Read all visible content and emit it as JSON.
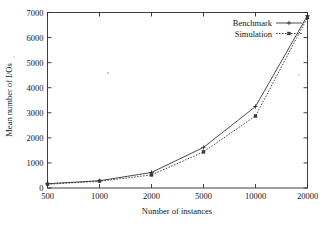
{
  "chart_data": {
    "type": "line",
    "title": "",
    "xlabel": "Number of instances",
    "ylabel": "Mean number of I/Os",
    "categories": [
      "500",
      "1000",
      "2000",
      "5000",
      "10000",
      "20000"
    ],
    "x_tick_labels": [
      "500",
      "1000",
      "2000",
      "5000",
      "10000",
      "20000"
    ],
    "y_tick_labels": [
      "0",
      "1000",
      "2000",
      "3000",
      "4000",
      "5000",
      "6000",
      "7000"
    ],
    "y_ticks": [
      0,
      1000,
      2000,
      3000,
      4000,
      5000,
      6000,
      7000
    ],
    "ylim": [
      0,
      7000
    ],
    "xlim_categorical": true,
    "grid": false,
    "legend_position": "top-right",
    "series": [
      {
        "name": "Benchmark",
        "style": "solid",
        "marker": "plus",
        "values": [
          170,
          290,
          620,
          1620,
          3250,
          6880
        ]
      },
      {
        "name": "Simulation",
        "style": "dotted",
        "marker": "square",
        "values": [
          150,
          270,
          520,
          1440,
          2870,
          6800
        ]
      }
    ]
  },
  "legend": {
    "entries": [
      {
        "label": "Benchmark",
        "style": "solid",
        "marker": "plus"
      },
      {
        "label": "Simulation",
        "style": "dotted",
        "marker": "square"
      }
    ]
  },
  "axes": {
    "y_title": "Mean number of I/Os",
    "x_title": "Number of instances"
  }
}
